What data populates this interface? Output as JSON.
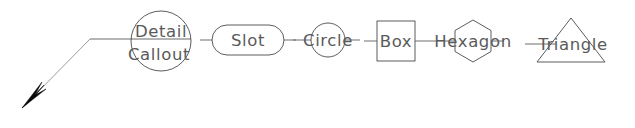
{
  "drawing": {
    "title": "CAD Leader Annotation Shapes",
    "background_color": "#ffffff",
    "stroke_color": "#4a4a4a",
    "leader_color": "#6b6b6b",
    "text_color": "#5a5a5a",
    "arrowhead_color": "#0a0a0a",
    "canvas": {
      "width": 635,
      "height": 128
    }
  },
  "annotations": [
    {
      "id": "detail-callout",
      "shape": "circle",
      "label_line_1": "Detail",
      "label_line_2": "Callout",
      "center_x": 161,
      "center_y": 41,
      "radius": 30,
      "has_leader": true,
      "has_arrowhead": true
    },
    {
      "id": "slot",
      "shape": "slot",
      "label": "Slot",
      "center_x": 248,
      "center_y": 40,
      "width": 72,
      "height": 30,
      "has_leader": false,
      "has_arrowhead": false
    },
    {
      "id": "circle",
      "shape": "circle",
      "label": "Circle",
      "center_x": 328,
      "center_y": 40,
      "radius": 17,
      "has_leader": false,
      "has_arrowhead": false
    },
    {
      "id": "box",
      "shape": "box",
      "label": "Box",
      "center_x": 396,
      "center_y": 41,
      "width": 38,
      "height": 40,
      "has_leader": false,
      "has_arrowhead": false
    },
    {
      "id": "hexagon",
      "shape": "hexagon",
      "label": "Hexagon",
      "center_x": 473,
      "center_y": 41,
      "radius": 21,
      "has_leader": false,
      "has_arrowhead": false
    },
    {
      "id": "triangle",
      "shape": "triangle",
      "label": "Triangle",
      "center_x": 571,
      "center_y": 44,
      "width": 68,
      "height": 43,
      "has_leader": false,
      "has_arrowhead": false
    }
  ],
  "leader": {
    "id": "detail-callout-leader",
    "arrow_tip_x": 22,
    "arrow_tip_y": 108,
    "elbow_x": 90,
    "elbow_y": 39,
    "landing_x": 191,
    "landing_y": 39,
    "arrowhead_style": "filled-solid"
  }
}
